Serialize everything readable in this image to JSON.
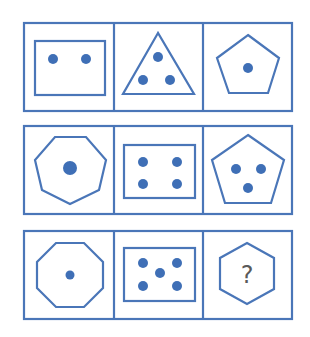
{
  "puzzle": {
    "title": "",
    "colors": {
      "stroke": "#4a76b8",
      "dot": "#3f6fb6",
      "question": "#5a5a5a"
    },
    "rows": [
      {
        "cells": [
          {
            "shape": "rectangle",
            "sides": 4,
            "dots": 2
          },
          {
            "shape": "triangle",
            "sides": 3,
            "dots": 3
          },
          {
            "shape": "pentagon",
            "sides": 5,
            "dots": 1
          }
        ]
      },
      {
        "cells": [
          {
            "shape": "heptagon",
            "sides": 7,
            "dots": 1
          },
          {
            "shape": "rectangle",
            "sides": 4,
            "dots": 4
          },
          {
            "shape": "pentagon",
            "sides": 5,
            "dots": 3
          }
        ]
      },
      {
        "cells": [
          {
            "shape": "octagon",
            "sides": 8,
            "dots": 1
          },
          {
            "shape": "rectangle",
            "sides": 4,
            "dots": 5
          },
          {
            "shape": "hexagon",
            "sides": 6,
            "dots": null,
            "label": "?"
          }
        ]
      }
    ]
  }
}
